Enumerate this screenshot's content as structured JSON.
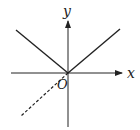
{
  "diagram": {
    "type": "coordinate-graph",
    "axes": {
      "x_label": "x",
      "y_label": "y",
      "origin_label": "O"
    },
    "colors": {
      "line": "#222222",
      "background": "#ffffff"
    },
    "elements": [
      {
        "name": "left-branch",
        "style": "solid",
        "from": "upper-left",
        "to": "origin"
      },
      {
        "name": "right-branch",
        "style": "solid",
        "from": "origin",
        "to": "upper-right"
      },
      {
        "name": "dashed-extension",
        "style": "dashed",
        "from": "origin",
        "to": "lower-left"
      }
    ]
  }
}
